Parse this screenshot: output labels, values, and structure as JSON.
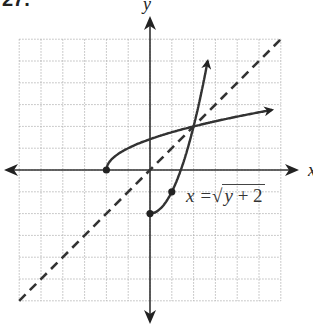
{
  "problem": {
    "number": "27.",
    "equation_lhs": "x =",
    "equation_radicand_var": "y",
    "equation_radicand_rest": " + 2",
    "equation_text": "x = √(y + 2)"
  },
  "axes": {
    "x_label": "x",
    "y_label": "y"
  },
  "chart_data": {
    "type": "line",
    "title": "",
    "xlabel": "x",
    "ylabel": "y",
    "xlim": [
      -6,
      6
    ],
    "ylim": [
      -6,
      6
    ],
    "grid": true,
    "grid_style": "dotted",
    "series": [
      {
        "name": "x = sqrt(y + 2)",
        "style": "solid",
        "points": [
          [
            0,
            -2
          ],
          [
            1,
            -1
          ],
          [
            1.414,
            0
          ],
          [
            2,
            2
          ],
          [
            2.3,
            3.3
          ],
          [
            2.6,
            5.0
          ]
        ],
        "endpoint_dot": [
          0,
          -2
        ],
        "marked_point": [
          1,
          -1
        ],
        "arrow": "end"
      },
      {
        "name": "y = sqrt(x + 2)",
        "style": "solid",
        "points": [
          [
            -2,
            0
          ],
          [
            -1,
            1
          ],
          [
            0,
            1.414
          ],
          [
            2,
            2
          ],
          [
            4.5,
            2.55
          ],
          [
            5.5,
            2.75
          ]
        ],
        "endpoint_dot": [
          -2,
          0
        ],
        "arrow": "end"
      },
      {
        "name": "y = x",
        "style": "dashed",
        "points": [
          [
            -6,
            -6
          ],
          [
            6,
            6
          ]
        ]
      }
    ],
    "annotations": [
      {
        "text": "x = √(y + 2)",
        "near": [
          1,
          -1
        ]
      }
    ]
  }
}
